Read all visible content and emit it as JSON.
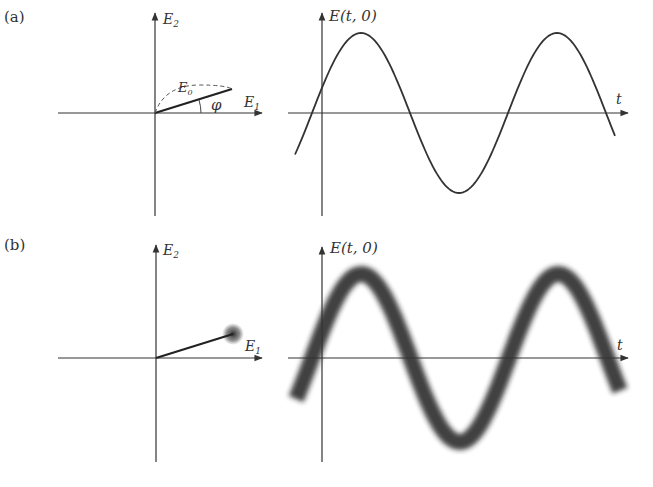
{
  "panels": [
    {
      "id": "a",
      "label": "(a)",
      "phasor": {
        "x_axis": "E",
        "x_sub": "1",
        "y_axis": "E",
        "y_sub": "2",
        "vector_label": "E",
        "vector_sub": "0",
        "angle_label": "φ"
      },
      "wave": {
        "y_label": "E(t, 0)",
        "x_label": "t"
      }
    },
    {
      "id": "b",
      "label": "(b)",
      "phasor": {
        "x_axis": "E",
        "x_sub": "1",
        "y_axis": "E",
        "y_sub": "2"
      },
      "wave": {
        "y_label": "E(t, 0)",
        "x_label": "t"
      }
    }
  ],
  "colors": {
    "ink": "#333333",
    "background": "#ffffff"
  }
}
